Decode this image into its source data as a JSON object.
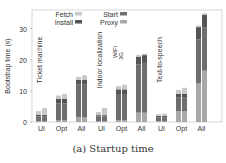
{
  "caption": "(a) Startup time",
  "colors": {
    "Fetch": "#c8c8c8",
    "Install": "#555555",
    "Start": "#6e6e6e",
    "Proxy": "#a8a8a8"
  },
  "chart_data": {
    "type": "bar",
    "stacked": true,
    "title": "(a) Startup time",
    "xlabel": "",
    "ylabel": "Bootstrap time (s)",
    "ylim": [
      0,
      36
    ],
    "yticks": [
      0,
      10,
      20,
      30
    ],
    "legend": [
      "Fetch",
      "Install",
      "Start",
      "Proxy"
    ],
    "legend_position": "top",
    "groups": [
      {
        "name": "Ticket machine",
        "categories": [
          "UI",
          "Opt",
          "All"
        ],
        "bars": [
          {
            "cat": "UI",
            "net": "WiFi",
            "Proxy": 0.3,
            "Start": 1.5,
            "Install": 0.5,
            "Fetch": 1.2
          },
          {
            "cat": "UI",
            "net": "3G",
            "Proxy": 0.3,
            "Start": 1.5,
            "Install": 0.5,
            "Fetch": 2.2
          },
          {
            "cat": "Opt",
            "net": "WiFi",
            "Proxy": 0.5,
            "Start": 5.5,
            "Install": 1.5,
            "Fetch": 1.0
          },
          {
            "cat": "Opt",
            "net": "3G",
            "Proxy": 0.5,
            "Start": 5.5,
            "Install": 1.5,
            "Fetch": 1.5
          },
          {
            "cat": "All",
            "net": "WiFi",
            "Proxy": 1.5,
            "Start": 10.5,
            "Install": 1.5,
            "Fetch": 1.0
          },
          {
            "cat": "All",
            "net": "3G",
            "Proxy": 1.5,
            "Start": 10.5,
            "Install": 1.5,
            "Fetch": 1.5
          }
        ]
      },
      {
        "name": "Indoor localization",
        "categories": [
          "UI",
          "Opt",
          "All"
        ],
        "annotations": [
          "WiFi",
          "3G"
        ],
        "bars": [
          {
            "cat": "UI",
            "net": "WiFi",
            "Proxy": 0.3,
            "Start": 1.5,
            "Install": 0.4,
            "Fetch": 1.0
          },
          {
            "cat": "UI",
            "net": "3G",
            "Proxy": 0.3,
            "Start": 1.5,
            "Install": 0.4,
            "Fetch": 2.3
          },
          {
            "cat": "Opt",
            "net": "WiFi",
            "Proxy": 0.5,
            "Start": 8.5,
            "Install": 1.5,
            "Fetch": 1.0
          },
          {
            "cat": "Opt",
            "net": "3G",
            "Proxy": 0.5,
            "Start": 8.5,
            "Install": 1.5,
            "Fetch": 1.5
          },
          {
            "cat": "All",
            "net": "WiFi",
            "Proxy": 3.0,
            "Start": 15.5,
            "Install": 2.5,
            "Fetch": 0.5
          },
          {
            "cat": "All",
            "net": "3G",
            "Proxy": 3.0,
            "Start": 16.0,
            "Install": 2.5,
            "Fetch": 0.5
          }
        ]
      },
      {
        "name": "Text-to-speech",
        "categories": [
          "UI",
          "Opt",
          "All"
        ],
        "bars": [
          {
            "cat": "UI",
            "net": "WiFi",
            "Proxy": 0.3,
            "Start": 1.2,
            "Install": 0.5,
            "Fetch": 0.5
          },
          {
            "cat": "UI",
            "net": "3G",
            "Proxy": 0.3,
            "Start": 1.2,
            "Install": 0.5,
            "Fetch": 0.7
          },
          {
            "cat": "Opt",
            "net": "WiFi",
            "Proxy": 3.5,
            "Start": 4.5,
            "Install": 1.0,
            "Fetch": 1.3
          },
          {
            "cat": "Opt",
            "net": "3G",
            "Proxy": 3.5,
            "Start": 4.5,
            "Install": 1.0,
            "Fetch": 2.0
          },
          {
            "cat": "All",
            "net": "WiFi",
            "Proxy": 12.5,
            "Start": 14.0,
            "Install": 4.0,
            "Fetch": 0.5
          },
          {
            "cat": "All",
            "net": "3G",
            "Proxy": 16.5,
            "Start": 14.0,
            "Install": 4.0,
            "Fetch": 0.5
          }
        ]
      }
    ]
  }
}
